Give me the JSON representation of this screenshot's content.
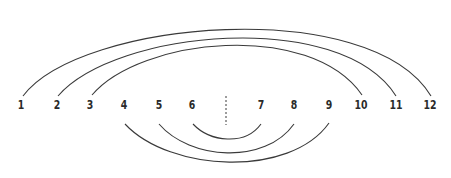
{
  "diagram": {
    "type": "arc-pairing",
    "nodes": [
      {
        "label": "1",
        "x": 21
      },
      {
        "label": "2",
        "x": 57
      },
      {
        "label": "3",
        "x": 90
      },
      {
        "label": "4",
        "x": 124
      },
      {
        "label": "5",
        "x": 159
      },
      {
        "label": "6",
        "x": 192
      },
      {
        "label": "7",
        "x": 261
      },
      {
        "label": "8",
        "x": 294
      },
      {
        "label": "9",
        "x": 329
      },
      {
        "label": "10",
        "x": 361
      },
      {
        "label": "11",
        "x": 396
      },
      {
        "label": "12",
        "x": 430
      }
    ],
    "arcs": [
      {
        "from": "1",
        "to": "12",
        "side": "top"
      },
      {
        "from": "2",
        "to": "11",
        "side": "top"
      },
      {
        "from": "3",
        "to": "10",
        "side": "top"
      },
      {
        "from": "4",
        "to": "9",
        "side": "bottom"
      },
      {
        "from": "5",
        "to": "8",
        "side": "bottom"
      },
      {
        "from": "6",
        "to": "7",
        "side": "bottom"
      }
    ],
    "center_divider": {
      "style": "dashed",
      "x": 226
    },
    "colors": {
      "stroke": "#3a3a3a",
      "text": "#2a2a2a",
      "background": "#ffffff"
    }
  }
}
